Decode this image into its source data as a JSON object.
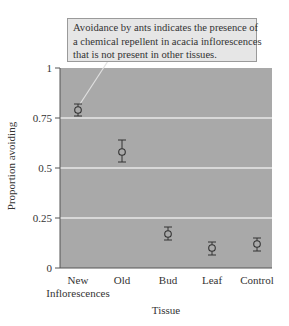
{
  "chart_data": {
    "type": "scatter",
    "title": "",
    "annotation": {
      "lines": [
        "Avoidance by ants indicates the presence of",
        "a chemical repellent in acacia inflorescences",
        "that is not present in other tissues."
      ],
      "points_to": "New Inflorescences"
    },
    "xlabel": "Tissue",
    "ylabel": "Proportion avoiding",
    "categories": [
      "New Inflorescences",
      "Old",
      "Bud",
      "Leaf",
      "Control"
    ],
    "category_labels": [
      [
        "New",
        "Inflorescences"
      ],
      [
        "Old"
      ],
      [
        "Bud"
      ],
      [
        "Leaf"
      ],
      [
        "Control"
      ]
    ],
    "values": [
      0.79,
      0.58,
      0.17,
      0.1,
      0.12
    ],
    "error_low": [
      0.76,
      0.53,
      0.14,
      0.065,
      0.085
    ],
    "error_high": [
      0.82,
      0.64,
      0.205,
      0.13,
      0.15
    ],
    "ylim": [
      0,
      1
    ],
    "yticks": [
      0,
      0.25,
      0.5,
      0.75,
      1
    ],
    "ytick_labels": [
      "0",
      "0.25",
      "0.5",
      "0.75",
      "1"
    ],
    "grid": true,
    "legend": null,
    "colors": {
      "plot_background": "#a9a9a9",
      "gridline": "#e8e8e8",
      "marker": "#333333",
      "callout_background": "#e6e6e6",
      "callout_border": "#9a9a9a"
    }
  }
}
